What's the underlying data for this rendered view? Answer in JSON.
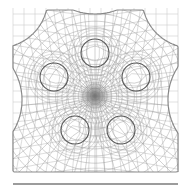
{
  "figure": {
    "type": "curvilinear mesh diagram",
    "colors": {
      "background": "#ffffff",
      "mesh": "#9a9a9a",
      "dense_mesh": "#6e6e6e",
      "hole_outline": "#555555",
      "base_line": "#3a3a3a",
      "background_grid": "#cfcfcf"
    },
    "center": [
      95,
      96
    ],
    "holes": [
      {
        "name": "top",
        "cx": 95,
        "cy": 53,
        "r": 14
      },
      {
        "name": "upper-left",
        "cx": 54,
        "cy": 77,
        "r": 14
      },
      {
        "name": "upper-right",
        "cx": 136,
        "cy": 77,
        "r": 14
      },
      {
        "name": "lower-left",
        "cx": 75,
        "cy": 130,
        "r": 14
      },
      {
        "name": "lower-right",
        "cx": 121,
        "cy": 130,
        "r": 14
      }
    ],
    "base_line": {
      "x1": 13,
      "x2": 178,
      "y": 184
    }
  }
}
